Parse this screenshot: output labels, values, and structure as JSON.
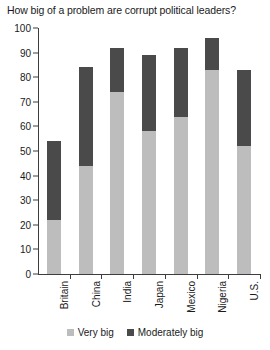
{
  "chart_data": {
    "type": "bar",
    "title": "How big of a problem are corrupt political leaders?",
    "xlabel": "",
    "ylabel": "",
    "ylim": [
      0,
      100
    ],
    "yticks": [
      0,
      10,
      20,
      30,
      40,
      50,
      60,
      70,
      80,
      90,
      100
    ],
    "grid": false,
    "stacked": true,
    "legend_position": "bottom",
    "categories": [
      "Britain",
      "China",
      "India",
      "Japan",
      "Mexico",
      "Nigeria",
      "U.S."
    ],
    "series": [
      {
        "name": "Very big",
        "color": "#bdbdbd",
        "values": [
          22,
          44,
          74,
          58,
          64,
          83,
          52
        ]
      },
      {
        "name": "Moderately big",
        "color": "#4a4a4a",
        "values": [
          32,
          40,
          18,
          31,
          28,
          13,
          31
        ]
      }
    ],
    "totals": [
      54,
      84,
      92,
      89,
      92,
      96,
      83
    ]
  }
}
